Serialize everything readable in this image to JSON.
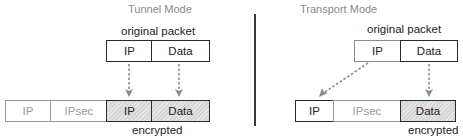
{
  "tunnel": {
    "title": "Tunnel Mode",
    "original_label": "original packet",
    "original_cells": [
      {
        "label": "IP"
      },
      {
        "label": "Data"
      }
    ],
    "result_cells": [
      {
        "label": "IP",
        "encrypted": false
      },
      {
        "label": "IPsec",
        "encrypted": false
      },
      {
        "label": "IP",
        "encrypted": true
      },
      {
        "label": "Data",
        "encrypted": true
      }
    ],
    "encrypted_label": "encrypted"
  },
  "transport": {
    "title": "Transport Mode",
    "original_label": "original packet",
    "original_cells": [
      {
        "label": "IP"
      },
      {
        "label": "Data"
      }
    ],
    "result_cells": [
      {
        "label": "IP",
        "encrypted": false
      },
      {
        "label": "IPsec",
        "encrypted": false
      },
      {
        "label": "Data",
        "encrypted": true
      }
    ],
    "encrypted_label": "encrypted"
  },
  "colors": {
    "border_dark": "#2a2a2a",
    "border_light": "#9a9a9a",
    "encrypted_fill": "#d6d6d6",
    "arrow": "#8a8a8a",
    "title_text": "#8a8a8a"
  }
}
